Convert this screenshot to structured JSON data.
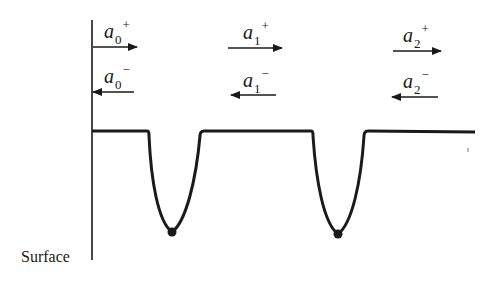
{
  "diagram": {
    "axis_label": "Surface",
    "colors": {
      "line": "#1a1a1a",
      "background": "#ffffff"
    },
    "potential_profile": {
      "baseline_level": "flat",
      "wells": [
        {
          "index": 0,
          "shape": "parabolic",
          "has_minimum_dot": true
        },
        {
          "index": 1,
          "shape": "parabolic",
          "has_minimum_dot": true
        }
      ]
    },
    "amplitudes": [
      {
        "region": 0,
        "plus": {
          "symbol": "a",
          "subscript": "0",
          "superscript": "+",
          "direction": "right"
        },
        "minus": {
          "symbol": "a",
          "subscript": "0",
          "superscript": "−",
          "direction": "left"
        }
      },
      {
        "region": 1,
        "plus": {
          "symbol": "a",
          "subscript": "1",
          "superscript": "+",
          "direction": "right"
        },
        "minus": {
          "symbol": "a",
          "subscript": "1",
          "superscript": "−",
          "direction": "left"
        }
      },
      {
        "region": 2,
        "plus": {
          "symbol": "a",
          "subscript": "2",
          "superscript": "+",
          "direction": "right"
        },
        "minus": {
          "symbol": "a",
          "subscript": "2",
          "superscript": "−",
          "direction": "left"
        }
      }
    ]
  }
}
